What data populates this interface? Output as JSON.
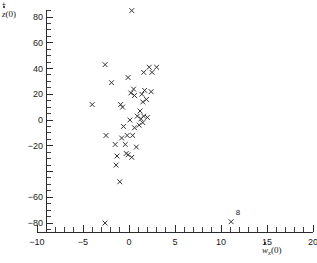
{
  "chart_data": {
    "type": "scatter",
    "title": "",
    "xlabel": "ẇx(0)",
    "ylabel": "ż+(0)",
    "xlabel_parts": {
      "symbol": "w",
      "accent": "dot",
      "subscript": "x",
      "arg": "(0)"
    },
    "ylabel_parts": {
      "symbol": "z",
      "accent": "dot",
      "superscript": "+",
      "arg": "(0)"
    },
    "xlim": [
      -10,
      20
    ],
    "ylim": [
      -88,
      92
    ],
    "grid": false,
    "legend": null,
    "marker": "x",
    "marker_color": "#333333",
    "xticks": [
      -10,
      -5,
      0,
      5,
      10,
      15,
      20
    ],
    "xticklabels": [
      "-10",
      "-5",
      "0",
      "5",
      "10",
      "15",
      "20"
    ],
    "x_minor_step": 1,
    "yticks": [
      80,
      60,
      40,
      20,
      0,
      -20,
      -40,
      -60,
      -80
    ],
    "yticklabels": [
      "80",
      "60",
      "40",
      "20",
      "0",
      "-20",
      "",
      "-60",
      "-80"
    ],
    "y_minor_step": 5,
    "annotations": [
      {
        "text": "8",
        "x": 11.6,
        "y": -74
      }
    ],
    "points": [
      {
        "x": 0.3,
        "y": 85
      },
      {
        "x": -2.6,
        "y": 43
      },
      {
        "x": 2.2,
        "y": 41
      },
      {
        "x": 3.0,
        "y": 41
      },
      {
        "x": 1.6,
        "y": 37
      },
      {
        "x": 2.5,
        "y": 37
      },
      {
        "x": -0.1,
        "y": 33
      },
      {
        "x": -1.9,
        "y": 29
      },
      {
        "x": 0.5,
        "y": 24
      },
      {
        "x": 1.7,
        "y": 23
      },
      {
        "x": 2.4,
        "y": 22
      },
      {
        "x": 0.2,
        "y": 21
      },
      {
        "x": 1.4,
        "y": 20
      },
      {
        "x": 0.6,
        "y": 19
      },
      {
        "x": 1.9,
        "y": 16
      },
      {
        "x": 1.5,
        "y": 14
      },
      {
        "x": -4.0,
        "y": 12
      },
      {
        "x": -0.9,
        "y": 12
      },
      {
        "x": -0.7,
        "y": 10
      },
      {
        "x": 1.2,
        "y": 7
      },
      {
        "x": 0.9,
        "y": 3
      },
      {
        "x": 1.6,
        "y": 3
      },
      {
        "x": 2.0,
        "y": 2
      },
      {
        "x": 1.3,
        "y": 1
      },
      {
        "x": 0.1,
        "y": 0
      },
      {
        "x": 1.5,
        "y": -2
      },
      {
        "x": 1.1,
        "y": -4
      },
      {
        "x": -0.6,
        "y": -5
      },
      {
        "x": 0.6,
        "y": -6
      },
      {
        "x": -2.5,
        "y": -12
      },
      {
        "x": -0.2,
        "y": -12
      },
      {
        "x": 0.4,
        "y": -12
      },
      {
        "x": -0.8,
        "y": -14
      },
      {
        "x": -1.5,
        "y": -19
      },
      {
        "x": -0.4,
        "y": -19
      },
      {
        "x": 0.8,
        "y": -21
      },
      {
        "x": -0.3,
        "y": -26
      },
      {
        "x": -0.1,
        "y": -27
      },
      {
        "x": -1.3,
        "y": -28
      },
      {
        "x": 0.3,
        "y": -29
      },
      {
        "x": -1.4,
        "y": -35
      },
      {
        "x": -1.0,
        "y": -48
      },
      {
        "x": -2.6,
        "y": -80
      },
      {
        "x": 11.1,
        "y": -79
      }
    ]
  }
}
